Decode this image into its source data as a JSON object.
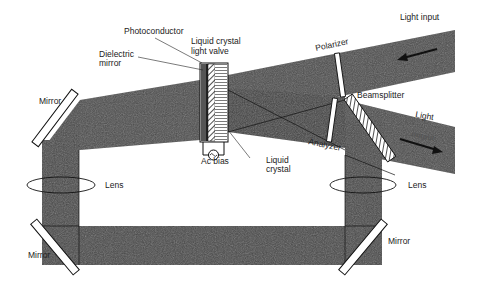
{
  "diagram": {
    "type": "optical-schematic",
    "colors": {
      "beam": "#4a4a4a",
      "beam_dark": "#333333",
      "background": "#ffffff",
      "line": "#111111"
    },
    "labels": {
      "photoconductor": "Photoconductor",
      "lc_light_valve_line1": "Liquid crystal",
      "lc_light_valve_line2": "light valve",
      "dielectric_mirror_line1": "Dielectric",
      "dielectric_mirror_line2": "mirror",
      "mirror_top_left": "Mirror",
      "mirror_bottom_left": "Mirror",
      "mirror_bottom_right": "Mirror",
      "lens_left": "Lens",
      "lens_right": "Lens",
      "ac_bias": "Ac bias",
      "liquid_crystal_line1": "Liquid",
      "liquid_crystal_line2": "crystal",
      "polarizer": "Polarizer",
      "beamsplitter": "Beamsplitter",
      "analyzer": "Analyzer",
      "light_input": "Light input",
      "light_output_line1": "Light",
      "light_output_line2": "output"
    },
    "icons": {
      "ac_source": "~"
    }
  }
}
